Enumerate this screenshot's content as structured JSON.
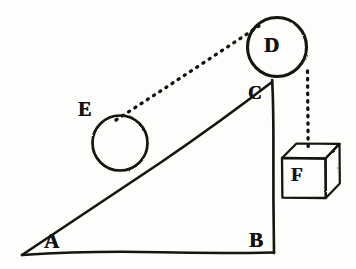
{
  "figure": {
    "style": "hand-drawn ink line illustration",
    "background_color": "#fdfdfb",
    "ink_color": "#141210",
    "width": 356,
    "height": 269
  },
  "labels": {
    "A": "A",
    "B": "B",
    "C": "C",
    "D": "D",
    "E": "E",
    "F": "F"
  },
  "geometry": {
    "incline_triangle": {
      "name": "right-triangle-ABC",
      "vertex_A": [
        22,
        255
      ],
      "vertex_B": [
        274,
        253
      ],
      "vertex_C": [
        272,
        80
      ],
      "right_angle_at": "B",
      "stroke": "#141210",
      "stroke_width": 2.4
    },
    "pulley_D": {
      "name": "pulley-wheel-D",
      "center": [
        277,
        47
      ],
      "radius": 30,
      "stroke": "#141210",
      "stroke_width": 3.0
    },
    "roller_E": {
      "name": "roller-ball-E",
      "center": [
        120,
        143
      ],
      "radius": 28,
      "stroke": "#141210",
      "stroke_width": 2.6
    },
    "weight_F": {
      "name": "hanging-weight-cube-F",
      "front_face": [
        [
          282,
          158
        ],
        [
          326,
          158
        ],
        [
          326,
          198
        ],
        [
          282,
          198
        ]
      ],
      "top_back_left": [
        296,
        143
      ],
      "top_back_right": [
        339,
        143
      ],
      "right_back_bottom": [
        339,
        184
      ],
      "stroke": "#141210",
      "stroke_width": 2.2
    },
    "cord_E_to_D": {
      "name": "dotted-cord-E-to-D",
      "from": [
        117,
        119
      ],
      "to": [
        259,
        26
      ],
      "style": "dotted",
      "stroke_width": 3.2
    },
    "cord_D_to_F": {
      "name": "dotted-cord-D-to-F",
      "from": [
        308,
        71
      ],
      "to": [
        308,
        150
      ],
      "style": "dotted",
      "stroke_width": 3.2
    }
  }
}
